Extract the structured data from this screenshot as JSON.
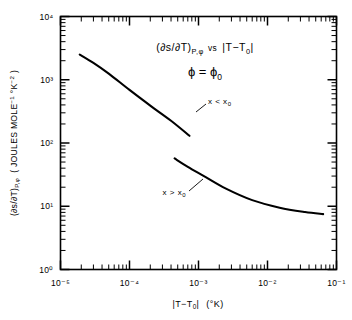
{
  "figure": {
    "background": "#ffffff",
    "ink": "#000000"
  },
  "chart_data": {
    "type": "line",
    "title": "",
    "annotations": [
      {
        "id": "relation",
        "text": "(∂s/∂T)P,φ  vs  |T−T0|"
      },
      {
        "id": "condition",
        "text": "φ = φ0"
      },
      {
        "id": "upper-curve-label",
        "text": "x < x0"
      },
      {
        "id": "lower-curve-label",
        "text": "x > x0"
      }
    ],
    "xlabel": "|T−T0|  (°K)",
    "ylabel": "(∂s/∂T)P,φ  ( JOULES MOLE⁻¹ °K⁻² )",
    "xscale": "log",
    "yscale": "log",
    "xlim": [
      1e-05,
      0.1
    ],
    "ylim": [
      1,
      10000
    ],
    "grid": false,
    "legend": "none",
    "xticks": [
      {
        "value": 1e-05,
        "label": "10⁻⁵"
      },
      {
        "value": 0.0001,
        "label": "10⁻⁴"
      },
      {
        "value": 0.001,
        "label": "10⁻³"
      },
      {
        "value": 0.01,
        "label": "10⁻²"
      },
      {
        "value": 0.1,
        "label": "10⁻¹"
      }
    ],
    "yticks": [
      {
        "value": 1,
        "label": "10⁰"
      },
      {
        "value": 10,
        "label": "10¹"
      },
      {
        "value": 100,
        "label": "10²"
      },
      {
        "value": 1000,
        "label": "10³"
      },
      {
        "value": 10000,
        "label": "10⁴"
      }
    ],
    "series": [
      {
        "name": "x < x0",
        "points": [
          [
            1.9e-05,
            2500
          ],
          [
            3e-05,
            1850
          ],
          [
            5e-05,
            1250
          ],
          [
            0.0001,
            690
          ],
          [
            0.0002,
            390
          ],
          [
            0.0004,
            225
          ],
          [
            0.00074,
            130
          ]
        ]
      },
      {
        "name": "x > x0",
        "points": [
          [
            0.00045,
            57
          ],
          [
            0.0007,
            42
          ],
          [
            0.0012,
            30
          ],
          [
            0.0025,
            19
          ],
          [
            0.006,
            12.5
          ],
          [
            0.015,
            9.5
          ],
          [
            0.035,
            8.1
          ],
          [
            0.064,
            7.5
          ]
        ]
      }
    ]
  },
  "yaxis_label_parts": {
    "prefix": "(∂s/∂T)",
    "subscript": "P,φ",
    "units": "( JOULES MOLE",
    "units_sup1": "−1",
    "units_mid": " °K",
    "units_sup2": "−2",
    "units_end": " )"
  },
  "xaxis_label_parts": {
    "bar_open": "|",
    "t": "T",
    "minus": "−",
    "t0": "T",
    "t0_sub": "0",
    "bar_close": "|",
    "units": "(°K)"
  },
  "annotation_parts": {
    "rel_prefix": "(∂s/∂T)",
    "rel_sub": "P,φ",
    "rel_vs": "vs",
    "rel_mod_open": "|T−T",
    "rel_mod_sub": "0",
    "rel_mod_close": "|",
    "cond_phi": "ϕ = ϕ",
    "cond_sub": "0",
    "upper_x": "x < x",
    "upper_sub": "0",
    "lower_x": "x > x",
    "lower_sub": "0"
  }
}
